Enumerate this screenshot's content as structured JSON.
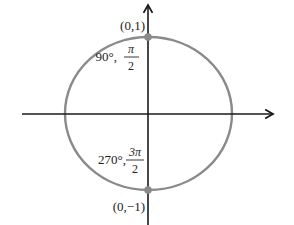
{
  "diagram": {
    "type": "unit-circle",
    "colors": {
      "circle": "#8a8a8a",
      "axes": "#1a1a1a",
      "points": "#8a8a8a",
      "text": "#222222"
    },
    "points": [
      {
        "name": "top",
        "coord_label": "(0,1)",
        "degree_label": "90°,",
        "radian_numerator": "π",
        "radian_denominator": "2"
      },
      {
        "name": "bottom",
        "coord_label": "(0,−1)",
        "degree_label": "270°,",
        "radian_numerator": "3π",
        "radian_denominator": "2"
      }
    ]
  }
}
